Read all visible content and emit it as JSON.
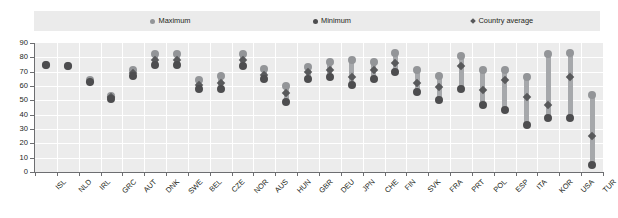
{
  "chart_data": {
    "type": "scatter",
    "title": "",
    "subtitle": "",
    "xlabel": "",
    "ylabel": "",
    "ylim": [
      0,
      90
    ],
    "yticks": [
      0,
      10,
      20,
      30,
      40,
      50,
      60,
      70,
      80,
      90
    ],
    "grid": true,
    "legend_position": "top",
    "legend": [
      "Maximum",
      "Minimum",
      "Country average"
    ],
    "categories": [
      "ISL",
      "NLD",
      "IRL",
      "GRC",
      "AUT",
      "DNK",
      "SWE",
      "BEL",
      "CZE",
      "NOR",
      "AUS",
      "HUN",
      "GBR",
      "DEU",
      "JPN",
      "CHE",
      "FIN",
      "SVK",
      "FRA",
      "PRT",
      "POL",
      "ESP",
      "ITA",
      "KOR",
      "USA",
      "TUR"
    ],
    "series": [
      {
        "name": "Maximum",
        "color": "#939598",
        "marker": "circle",
        "values": [
          75,
          74,
          64,
          53,
          71,
          82,
          82,
          64,
          67,
          82,
          72,
          60,
          73,
          77,
          78,
          77,
          83,
          71,
          67,
          81,
          71,
          71,
          66,
          82,
          83,
          54
        ]
      },
      {
        "name": "Minimum",
        "color": "#4d4d4f",
        "marker": "circle",
        "values": [
          75,
          74,
          63,
          51,
          67,
          75,
          75,
          58,
          58,
          74,
          65,
          49,
          65,
          66,
          61,
          65,
          70,
          56,
          50,
          58,
          47,
          43,
          33,
          38,
          38,
          5
        ]
      },
      {
        "name": "Country average",
        "color": "#58595b",
        "marker": "diamond",
        "values": [
          75,
          74,
          63,
          52,
          69,
          78,
          78,
          61,
          62,
          78,
          68,
          55,
          70,
          71,
          66,
          71,
          76,
          62,
          59,
          74,
          57,
          64,
          52,
          47,
          66,
          25
        ]
      }
    ]
  },
  "legend": {
    "items": [
      {
        "label": "Maximum",
        "shape": "circle",
        "color": "#939598"
      },
      {
        "label": "Minimum",
        "shape": "circle",
        "color": "#4d4d4f"
      },
      {
        "label": "Country average",
        "shape": "diamond",
        "color": "#58595b"
      }
    ]
  },
  "axes": {
    "y_tick_labels": [
      "90",
      "80",
      "70",
      "60",
      "50",
      "40",
      "30",
      "20",
      "10",
      "0"
    ]
  }
}
